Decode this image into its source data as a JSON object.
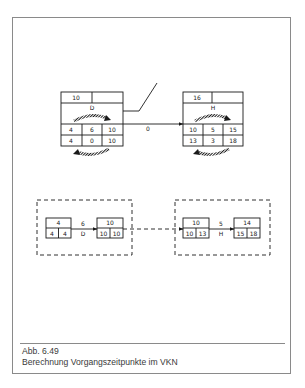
{
  "figure": {
    "number": "Abb. 6.49",
    "title": "Berechnung Vorgangszeitpunkte im VKN"
  },
  "vkn": {
    "node_d": {
      "label": "D",
      "top_left": "10",
      "top_right": "",
      "row1": [
        "4",
        "6",
        "10"
      ],
      "row2": [
        "4",
        "0",
        "10"
      ]
    },
    "node_h": {
      "label": "H",
      "top_left": "16",
      "top_right": "",
      "row1": [
        "10",
        "5",
        "15"
      ],
      "row2": [
        "13",
        "3",
        "18"
      ]
    },
    "link_label": "0"
  },
  "ekn": {
    "event_1": {
      "top": "4",
      "bottom": [
        "4",
        "4"
      ]
    },
    "activity_d": {
      "duration": "6",
      "label": "D"
    },
    "event_2": {
      "top": "10",
      "bottom": [
        "10",
        "10"
      ]
    },
    "event_3": {
      "top": "10",
      "bottom": [
        "10",
        "13"
      ]
    },
    "activity_h": {
      "duration": "5",
      "label": "H"
    },
    "event_4": {
      "top": "14",
      "bottom": [
        "15",
        "18"
      ]
    }
  },
  "colors": {
    "line": "#1a1a1a",
    "frame": "#8a8a8a",
    "caption": "#3a3a3a"
  }
}
